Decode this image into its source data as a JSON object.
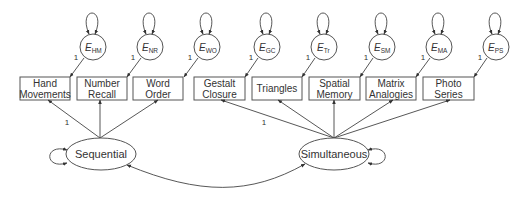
{
  "diagram": {
    "type": "structural-equation-model",
    "latent_factors": [
      {
        "id": "seq",
        "label": "Sequential"
      },
      {
        "id": "sim",
        "label": "Simultaneous"
      }
    ],
    "observed": [
      {
        "line1": "Hand",
        "line2": "Movements",
        "error": {
          "E": "E",
          "sub": "HM"
        },
        "error_loading": "1",
        "factor": "seq"
      },
      {
        "line1": "Number",
        "line2": "Recall",
        "error": {
          "E": "E",
          "sub": "NR"
        },
        "error_loading": "1",
        "factor": "seq"
      },
      {
        "line1": "Word",
        "line2": "Order",
        "error": {
          "E": "E",
          "sub": "WO"
        },
        "error_loading": "1",
        "factor": "seq"
      },
      {
        "line1": "Gestalt",
        "line2": "Closure",
        "error": {
          "E": "E",
          "sub": "GC"
        },
        "error_loading": "1",
        "factor": "sim"
      },
      {
        "line1": "Triangles",
        "line2": "",
        "error": {
          "E": "E",
          "sub": "Tr"
        },
        "error_loading": "1",
        "factor": "sim"
      },
      {
        "line1": "Spatial",
        "line2": "Memory",
        "error": {
          "E": "E",
          "sub": "SM"
        },
        "error_loading": "1",
        "factor": "sim"
      },
      {
        "line1": "Matrix",
        "line2": "Analogies",
        "error": {
          "E": "E",
          "sub": "MA"
        },
        "error_loading": "1",
        "factor": "sim"
      },
      {
        "line1": "Photo",
        "line2": "Series",
        "error": {
          "E": "E",
          "sub": "PS"
        },
        "error_loading": "1",
        "factor": "sim"
      }
    ],
    "factor_loading_labels": {
      "seq": "1",
      "sim": "1"
    },
    "covariance": "Sequential <-> Simultaneous"
  }
}
